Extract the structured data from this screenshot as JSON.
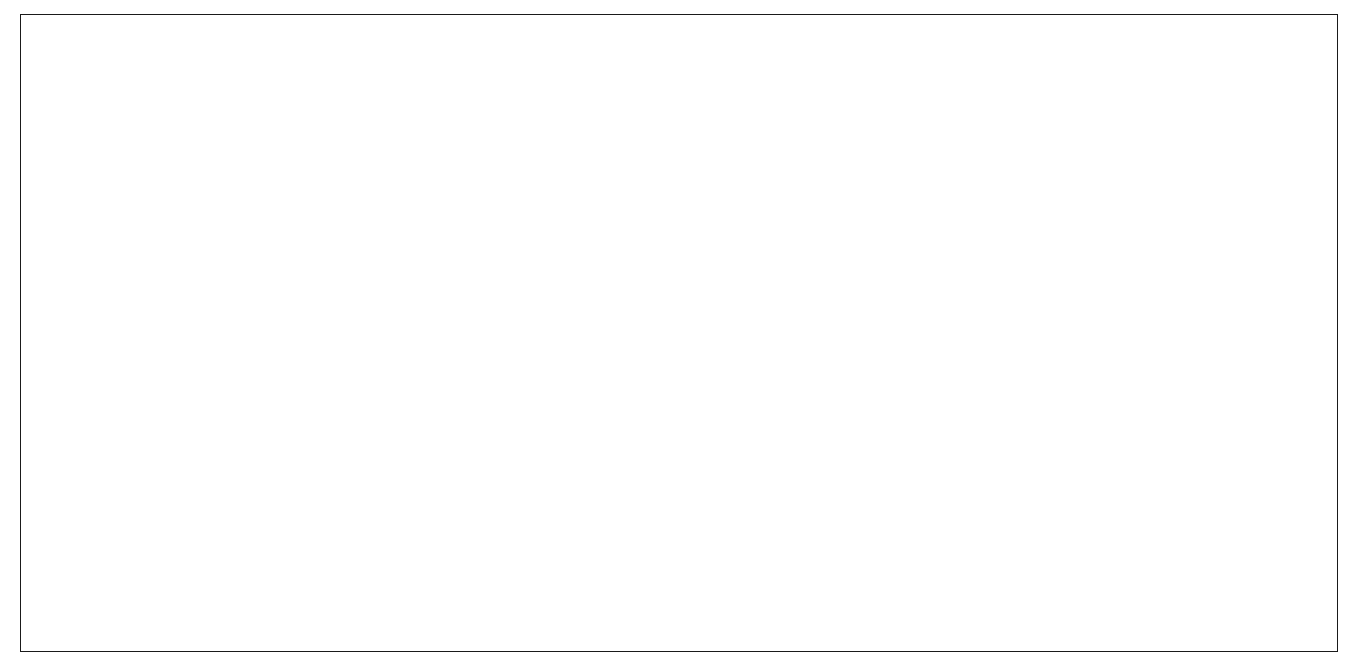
{
  "chart_data": {
    "type": "line",
    "title": "",
    "xlabel": "",
    "ylabel": "Reductions relative to the baseline (%)",
    "x": [
      1990,
      2000,
      2010,
      2020,
      2030,
      2040,
      2050,
      2060,
      2070,
      2080,
      2090,
      2100
    ],
    "xticklabels": [
      "1990",
      "2000",
      "2010",
      "2020",
      "2030",
      "2040",
      "2050",
      "2060",
      "2070",
      "2080",
      "2090",
      "2100"
    ],
    "yticklabels": [
      "0",
      "10",
      "20",
      "30",
      "40",
      "50",
      "60",
      "70",
      "80",
      "90",
      "100"
    ],
    "ylim": [
      0,
      100
    ],
    "xlim": [
      1990,
      2100
    ],
    "ytick_step": 10,
    "grid": "horizontal",
    "legend_position": "top-left",
    "plot_background": "#f2f2f2",
    "series": [
      {
        "name": "Ext Path",
        "color": "#000000",
        "marker": "diamond",
        "values": [
          0.0,
          0.4,
          10.5,
          20.7,
          29.8,
          33.4,
          38.7,
          42.7,
          46.6,
          50.4,
          50.1,
          49.5
        ]
      },
      {
        "name": "LTCM",
        "color": "#7f7f7f",
        "marker": "square",
        "values": [
          0.0,
          2.3,
          3.7,
          6.6,
          14.8,
          20.7,
          32.9,
          40.1,
          51.7,
          59.8,
          65.7,
          66.8
        ]
      },
      {
        "name": "Ext Path 450",
        "color": "#595959",
        "marker": "triangle",
        "values": [
          0.0,
          9.5,
          22.1,
          33.8,
          45.7,
          52.2,
          59.2,
          62.3,
          65.4,
          66.2,
          65.8,
          65.7
        ]
      },
      {
        "name": "LTCM 450",
        "color": "#b3b3b3",
        "marker": "asterisk",
        "values": [
          0.0,
          6.4,
          6.0,
          6.3,
          14.8,
          48.9,
          61.7,
          76.4,
          76.9,
          79.7,
          82.8,
          85.5
        ]
      }
    ]
  },
  "legend": {
    "items": [
      {
        "label": "Ext Path"
      },
      {
        "label": "LTCM"
      },
      {
        "label": "Ext Path 450"
      },
      {
        "label": "LTCM 450"
      }
    ]
  },
  "colors": {
    "frame": "#1a1a1a",
    "axis": "#000000",
    "gridline": "#a6a6a6",
    "plot_area": "#f2f2f2",
    "legend_border": "#000000"
  }
}
